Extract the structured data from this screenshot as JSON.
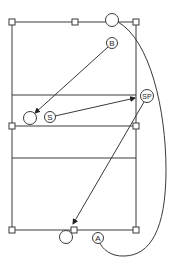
{
  "diagram": {
    "type": "volleyball-court-drill",
    "colors": {
      "stroke": "#3a3a3a",
      "background": "#ffffff",
      "text": "#222222"
    },
    "court": {
      "left": 12,
      "right": 136,
      "top": 22,
      "bottom": 230
    },
    "lines": [
      {
        "name": "attack-line-top",
        "y": 95
      },
      {
        "name": "net-line",
        "y": 126
      },
      {
        "name": "attack-line-bottom",
        "y": 158
      }
    ],
    "cones": [
      {
        "x": 12,
        "y": 22
      },
      {
        "x": 75,
        "y": 22
      },
      {
        "x": 136,
        "y": 22
      },
      {
        "x": 12,
        "y": 126
      },
      {
        "x": 136,
        "y": 126
      },
      {
        "x": 12,
        "y": 230
      },
      {
        "x": 74,
        "y": 230
      },
      {
        "x": 136,
        "y": 230
      }
    ],
    "players": [
      {
        "id": "B",
        "label": "B",
        "x": 112,
        "y": 43,
        "r": 5.5
      },
      {
        "id": "S",
        "label": "S",
        "x": 50,
        "y": 117,
        "r": 5.5
      },
      {
        "id": "SP",
        "label": "SP",
        "x": 147,
        "y": 96,
        "r": 6.5
      },
      {
        "id": "A",
        "label": "A",
        "x": 98,
        "y": 238,
        "r": 5.5
      }
    ],
    "targets": [
      {
        "name": "target-top",
        "x": 112,
        "y": 20,
        "r": 6.5
      },
      {
        "name": "target-left",
        "x": 30,
        "y": 118,
        "r": 6.5
      },
      {
        "name": "target-bottom",
        "x": 66,
        "y": 237,
        "r": 6.5
      }
    ],
    "arrows": [
      {
        "from": "B",
        "to": "target-left"
      },
      {
        "from": "S",
        "to": "SP"
      },
      {
        "from": "SP",
        "to": "cone-bottom-center"
      }
    ],
    "curve": {
      "from": "target-top",
      "to": "A",
      "description": "player path around right side"
    }
  }
}
